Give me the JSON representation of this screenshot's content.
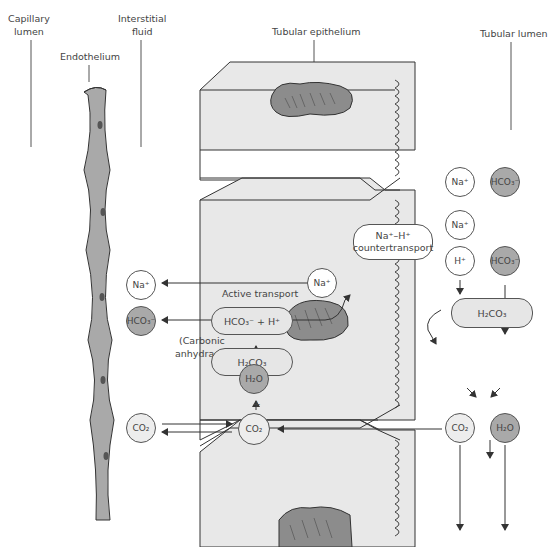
{
  "labels": {
    "capillary_lumen": [
      "Capillary",
      "lumen"
    ],
    "interstitial_fluid": [
      "Interstitial",
      "fluid"
    ],
    "endothelium": "Endothelium",
    "tubular_epithelium": "Tubular epithelium",
    "tubular_lumen": "Tubular lumen",
    "active_transport": "Active transport",
    "carbonic_anhydrase": [
      "(Carbonic",
      "anhydrase)"
    ],
    "countertransport": [
      "Na⁺–H⁺",
      "countertransport"
    ],
    "plus_sign": "+"
  },
  "nodes": {
    "interstitial_na": "Na⁺",
    "interstitial_hco3": "HCO₃⁻",
    "interstitial_co2": "CO₂",
    "cell_na": "Na⁺",
    "cell_hco3_h": "HCO₃⁻ + H⁺",
    "cell_h2co3": "H₂CO₃",
    "cell_h2o": "H₂O",
    "cell_co2": "CO₂",
    "lumen_na_top": "Na⁺",
    "lumen_na_mid": "Na⁺",
    "lumen_h": "H⁺",
    "lumen_hco3_top": "HCO₃⁻",
    "lumen_hco3_bottom": "HCO₃⁻",
    "lumen_h2co3": "H₂CO₃",
    "lumen_co2": "CO₂",
    "lumen_h2o": "H₂O"
  },
  "colors": {
    "cell_fill": "#e8e8e8",
    "dark_grey": "#a9a9a9",
    "mitochondria": "#8c8c8c",
    "line": "#444444"
  }
}
